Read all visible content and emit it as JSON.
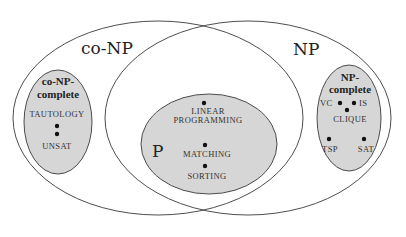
{
  "diagram": {
    "colors": {
      "background": "#ffffff",
      "outline": "#3a3a3a",
      "shaded_fill": "#d6d6d6",
      "text": "#222222"
    },
    "classes": {
      "conp": {
        "label": "co-NP"
      },
      "np": {
        "label": "NP"
      },
      "p": {
        "label": "P",
        "problems": [
          "LINEAR",
          "PROGRAMMING",
          "MATCHING",
          "SORTING"
        ]
      },
      "conp_complete": {
        "label_line1": "co-NP-",
        "label_line2": "complete",
        "problems": [
          "TAUTOLOGY",
          "UNSAT"
        ]
      },
      "np_complete": {
        "label_line1": "NP-",
        "label_line2": "complete",
        "problems": [
          "VC",
          "IS",
          "CLIQUE",
          "TSP",
          "SAT"
        ]
      }
    }
  }
}
